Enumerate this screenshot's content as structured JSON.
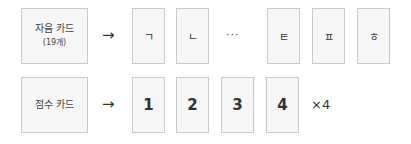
{
  "rows": [
    {
      "label": "자음 카드",
      "sublabel": "(19개)",
      "arrow": "→",
      "cards": [
        "ㄱ",
        "ㄴ",
        "ㅌ",
        "ㅍ",
        "ㅎ"
      ],
      "ellipsis": "···"
    },
    {
      "label": "점수 카드",
      "arrow": "→",
      "cards": [
        "1",
        "2",
        "3",
        "4"
      ],
      "multiplier": "×4"
    }
  ]
}
